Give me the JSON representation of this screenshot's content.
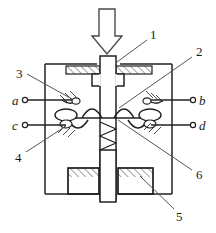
{
  "figure": {
    "background_color": "#ffffff",
    "line_color": "#222222",
    "hatch_color": "#333333",
    "width": 216,
    "height": 233
  },
  "force_arrow": {
    "name": "applied-force-arrow",
    "direction": "down",
    "label": ""
  },
  "callouts": [
    {
      "id": "1",
      "label": "1",
      "points_to": "push-rod-shaft",
      "x": 150,
      "y": 35
    },
    {
      "id": "2",
      "label": "2",
      "points_to": "moving-contact-bridge",
      "x": 196,
      "y": 52
    },
    {
      "id": "3",
      "label": "3",
      "points_to": "upper-fixed-contact",
      "x": 16,
      "y": 74
    },
    {
      "id": "4",
      "label": "4",
      "points_to": "lower-fixed-contact",
      "x": 15,
      "y": 158
    },
    {
      "id": "5",
      "label": "5",
      "points_to": "housing-base",
      "x": 178,
      "y": 214
    },
    {
      "id": "6",
      "label": "6",
      "points_to": "return-spring",
      "x": 196,
      "y": 175
    }
  ],
  "terminals": [
    {
      "id": "a",
      "label": "a",
      "side": "left",
      "row": "upper",
      "x": 14,
      "y": 103
    },
    {
      "id": "b",
      "label": "b",
      "side": "right",
      "row": "upper",
      "x": 202,
      "y": 103
    },
    {
      "id": "c",
      "label": "c",
      "side": "left",
      "row": "lower",
      "x": 14,
      "y": 128
    },
    {
      "id": "d",
      "label": "d",
      "side": "right",
      "row": "lower",
      "x": 202,
      "y": 128
    }
  ],
  "parts": {
    "housing": "housing-outline",
    "shaft": "push-rod-shaft",
    "collar": "shaft-collar",
    "spring": "return-spring",
    "bridge": "moving-contact-bridge",
    "top_wall": "housing-top-wall",
    "base_blocks": "housing-base"
  }
}
